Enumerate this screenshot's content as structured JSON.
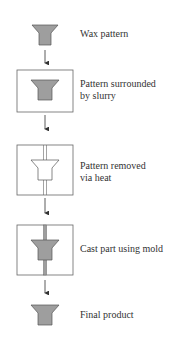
{
  "steps": [
    {
      "label": "Wax pattern"
    },
    {
      "label": "Pattern surrounded by slurry",
      "line1": "Pattern surrounded",
      "line2": "by slurry"
    },
    {
      "label": "Pattern removed via heat",
      "line1": "Pattern removed",
      "line2": "via heat"
    },
    {
      "label": "Cast part using mold"
    },
    {
      "label": "Final product"
    }
  ],
  "colors": {
    "part_fill": "#9e9e9e",
    "part_stroke": "#555555",
    "box_stroke": "#666666",
    "arrow": "#333333"
  }
}
